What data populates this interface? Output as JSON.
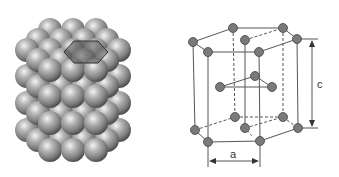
{
  "figure": {
    "left": {
      "title": "HCP sphere packing model",
      "sphere_color": "#9a9a9a",
      "highlight_hexagon_color": "#505050"
    },
    "right": {
      "title": "HCP unit cell",
      "atom_color": "#7a7a7a",
      "line_color": "#555555",
      "labels": {
        "a": "a",
        "c": "c"
      }
    }
  }
}
